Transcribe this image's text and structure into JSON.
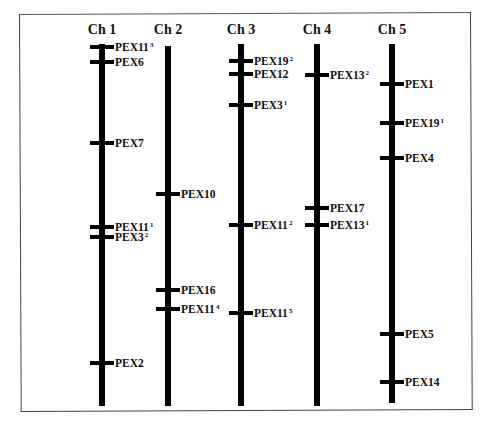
{
  "figure": {
    "type": "chromosome-map",
    "chromosomes": [
      {
        "label": "Ch 1",
        "x": 102,
        "top": 44,
        "bottom": 406,
        "genes": [
          {
            "name": "PEX11",
            "sup": "3",
            "y": 47
          },
          {
            "name": "PEX6",
            "sup": "",
            "y": 62
          },
          {
            "name": "PEX7",
            "sup": "",
            "y": 143
          },
          {
            "name": "PEX11",
            "sup": "1",
            "y": 227
          },
          {
            "name": "PEX3",
            "sup": "2",
            "y": 237
          },
          {
            "name": "PEX2",
            "sup": "",
            "y": 363
          }
        ]
      },
      {
        "label": "Ch 2",
        "x": 168,
        "top": 46,
        "bottom": 406,
        "genes": [
          {
            "name": "PEX10",
            "sup": "",
            "y": 194
          },
          {
            "name": "PEX16",
            "sup": "",
            "y": 290
          },
          {
            "name": "PEX11",
            "sup": "4",
            "y": 309
          }
        ]
      },
      {
        "label": "Ch 3",
        "x": 241,
        "top": 44,
        "bottom": 406,
        "genes": [
          {
            "name": "PEX19",
            "sup": "2",
            "y": 61
          },
          {
            "name": "PEX12",
            "sup": "",
            "y": 74
          },
          {
            "name": "PEX3",
            "sup": "1",
            "y": 105
          },
          {
            "name": "PEX11",
            "sup": "2",
            "y": 225
          },
          {
            "name": "PEX11",
            "sup": "5",
            "y": 313
          }
        ]
      },
      {
        "label": "Ch 4",
        "x": 317,
        "top": 44,
        "bottom": 406,
        "genes": [
          {
            "name": "PEX13",
            "sup": "2",
            "y": 75
          },
          {
            "name": "PEX17",
            "sup": "",
            "y": 208
          },
          {
            "name": "PEX13",
            "sup": "1",
            "y": 225
          }
        ]
      },
      {
        "label": "Ch 5",
        "x": 392,
        "top": 44,
        "bottom": 403,
        "genes": [
          {
            "name": "PEX1",
            "sup": "",
            "y": 84
          },
          {
            "name": "PEX19",
            "sup": "1",
            "y": 123
          },
          {
            "name": "PEX4",
            "sup": "",
            "y": 158
          },
          {
            "name": "PEX5",
            "sup": "",
            "y": 334
          },
          {
            "name": "PEX14",
            "sup": "",
            "y": 382
          }
        ]
      }
    ],
    "colors": {
      "bar": "#000000",
      "text": "#111111",
      "frame": "#444444",
      "background": "#ffffff"
    }
  }
}
